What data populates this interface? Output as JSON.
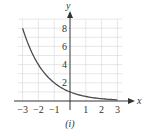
{
  "chart_data": {
    "type": "line",
    "title": "",
    "xlabel": "x",
    "ylabel": "y",
    "caption": "(i)",
    "xlim": [
      -3,
      3
    ],
    "ylim": [
      0,
      8
    ],
    "grid": true,
    "x_ticks": [
      -3,
      -2,
      -1,
      1,
      2,
      3
    ],
    "x_tick_labels": [
      "−3",
      "−2",
      "−1",
      "1",
      "2",
      "3"
    ],
    "y_ticks": [
      2,
      4,
      6,
      8
    ],
    "y_tick_labels": [
      "2",
      "4",
      "6",
      "8"
    ],
    "series": [
      {
        "name": "y = (1/2)^x",
        "x": [
          -3,
          -2.5,
          -2,
          -1.5,
          -1,
          -0.5,
          0,
          0.5,
          1,
          1.5,
          2,
          2.5,
          3
        ],
        "y": [
          8,
          5.657,
          4,
          2.828,
          2,
          1.414,
          1,
          0.707,
          0.5,
          0.354,
          0.25,
          0.177,
          0.125
        ]
      }
    ],
    "colors": {
      "curve": "#4a4a4a",
      "axis": "#333333",
      "grid": "#dddddd"
    }
  }
}
